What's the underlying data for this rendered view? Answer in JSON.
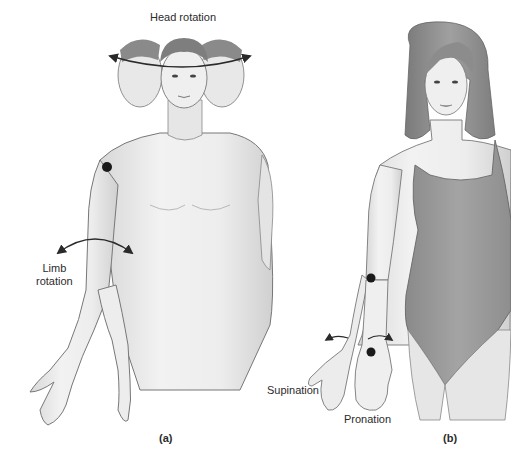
{
  "figure": {
    "panels": [
      {
        "id": "a",
        "label": "(a)",
        "subject": "male figure, front view, shirtless",
        "annotations": {
          "head_rotation": "Head rotation",
          "limb_rotation_line1": "Limb",
          "limb_rotation_line2": "rotation"
        },
        "markers": [
          "shoulder-joint-dot"
        ]
      },
      {
        "id": "b",
        "label": "(b)",
        "subject": "female figure, front view, one-piece swimsuit",
        "annotations": {
          "supination": "Supination",
          "pronation": "Pronation"
        },
        "markers": [
          "elbow-dot",
          "wrist-dot"
        ]
      }
    ],
    "colors": {
      "background": "#ffffff",
      "skin": "#ececec",
      "skin_shadow": "#d4d4d4",
      "outline": "#6e6e6e",
      "hair": "#8a8a8a",
      "swimsuit": "#9a9a9a",
      "arrow": "#2a2a2a",
      "marker": "#1a1a1a",
      "text": "#2b2b2b"
    }
  }
}
